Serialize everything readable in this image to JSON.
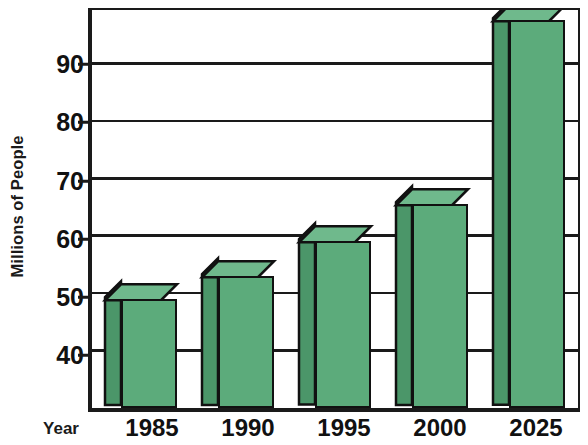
{
  "chart_data": {
    "type": "bar",
    "title": "",
    "subtitle": "",
    "xlabel": "Year",
    "ylabel": "Millions of People",
    "categories": [
      "1985",
      "1990",
      "1995",
      "2000",
      "2025"
    ],
    "values": [
      49,
      53,
      59,
      65.5,
      97.5
    ],
    "series": [
      {
        "name": "Millions of People",
        "values": [
          49,
          53,
          59,
          65.5,
          97.5
        ]
      }
    ],
    "ylim": [
      30,
      99.3
    ],
    "yticks": [
      40,
      50,
      60,
      70,
      80,
      90
    ],
    "ytick_labels": [
      "40",
      "50",
      "60",
      "70",
      "80",
      "90"
    ],
    "grid": true,
    "grid_axis": "y",
    "legend": false,
    "legend_position": "none",
    "bar_style": "3d-extruded",
    "colors": {
      "bar_front": "#5cab7b",
      "bar_side": "#4b9669",
      "bar_top": "#6fb98c",
      "outline": "#111111",
      "axis": "#1a1a1a",
      "background": "#ffffff"
    }
  },
  "axes": {
    "y_title": "Millions of People",
    "x_title": "Year"
  }
}
